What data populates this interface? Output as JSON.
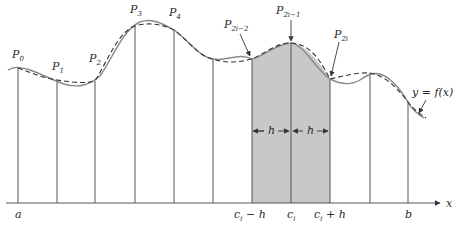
{
  "diagram": {
    "axis_label": "x",
    "curve_label": "y = f(x)",
    "points": [
      {
        "name": "P",
        "sub": "0"
      },
      {
        "name": "P",
        "sub": "1"
      },
      {
        "name": "P",
        "sub": "2"
      },
      {
        "name": "P",
        "sub": "3"
      },
      {
        "name": "P",
        "sub": "4"
      },
      {
        "name": "P",
        "sub": "2i−2"
      },
      {
        "name": "P",
        "sub": "2i−1"
      },
      {
        "name": "P",
        "sub": "2i"
      }
    ],
    "x_labels": {
      "a": "a",
      "ci_minus_h": "c",
      "ci_minus_h_sub": "i",
      "ci_minus_h_tail": " − h",
      "ci": "c",
      "ci_sub": "i",
      "ci_plus_h": "c",
      "ci_plus_h_sub": "i",
      "ci_plus_h_tail": " + h",
      "b": "b"
    },
    "width_labels": [
      "h",
      "h"
    ],
    "colors": {
      "shade": "#c8c8c8",
      "curve": "#8a8a8a",
      "dashed": "#333333",
      "lines": "#555555"
    },
    "legend": {
      "solid": "y = f(x)",
      "dashed": "parabolic approximations"
    }
  }
}
